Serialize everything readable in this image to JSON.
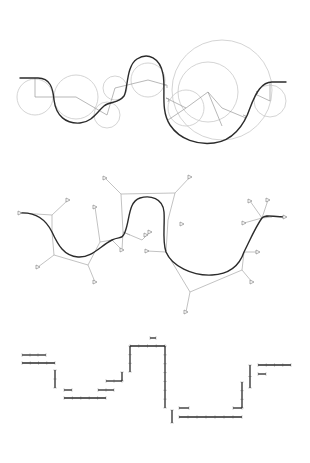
{
  "figure": {
    "panels": [
      {
        "id": "circles",
        "description": "Curve built from tangent circular arcs with radial construction lines",
        "colors": {
          "curve": "#2b2b2b",
          "construction": "#c9c9c9",
          "radials": "#9a9a9a"
        },
        "curve_points": "M20,78 L38,78 C50,78 53,88 54,100 C56,116 66,124 80,123 C92,122 97,112 104,106 C110,101 118,104 124,96 C128,90 126,66 137,59 C148,52 160,58 163,74 C166,88 160,110 170,125 C180,140 198,145 214,143 C232,141 244,126 250,108 C256,92 262,82 272,82 L286,82",
        "circles": [
          {
            "cx": 35,
            "cy": 97,
            "r": 18
          },
          {
            "cx": 76,
            "cy": 97,
            "r": 22
          },
          {
            "cx": 115,
            "cy": 88,
            "r": 12
          },
          {
            "cx": 107,
            "cy": 115,
            "r": 13
          },
          {
            "cx": 148,
            "cy": 80,
            "r": 17
          },
          {
            "cx": 186,
            "cy": 108,
            "r": 18
          },
          {
            "cx": 208,
            "cy": 92,
            "r": 30
          },
          {
            "cx": 222,
            "cy": 90,
            "r": 50
          },
          {
            "cx": 270,
            "cy": 101,
            "r": 16
          }
        ],
        "radials": "M35,78 L35,97 L76,97 L107,115 L115,88 L148,80 L166,85 M166,98 L186,108 L208,92 L222,126 M208,92 L222,108 L246,118 M186,108 L168,120 M270,82 L270,101 L255,94"
      },
      {
        "id": "polygons",
        "description": "Spline curve with control polygons and handle markers",
        "colors": {
          "curve": "#2b2b2b",
          "polygon": "#a8a8a8",
          "marker": "#8a8a8a"
        },
        "curve_points": "M20,53 C35,52 45,58 52,72 C58,85 64,96 78,97 C92,98 100,86 112,80 C120,76 122,80 125,72 C130,60 128,42 140,38 C150,35 163,38 164,52 C165,66 162,80 166,92 C172,106 192,116 212,115 C232,114 240,104 244,92 C250,80 256,66 262,58 C266,54 272,57 285,57",
        "polygons": "M52,55 L52,72 L54,95 L88,105 L100,82 L112,80 M52,55 L20,53 M52,55 L68,40 M54,95 L38,107 M88,105 L95,122 M100,82 L95,47 M112,80 L122,90 M122,90 L123,72 L130,75 M123,72 L142,80 L150,72 M123,72 L121,34 L175,33 L168,60 L166,92 M121,34 L105,18 M175,33 L190,17 M166,92 L147,91 M166,92 L190,132 L242,110 L244,92 M190,132 L186,152 M242,110 L252,122 M244,92 L258,92 M262,58 L272,57 M262,58 L250,41 M262,58 L268,40 M262,58 L244,63"
      },
      {
        "id": "steps",
        "description": "Staircase of axis-aligned bars with tick marks",
        "colors": {
          "bar": "#2b2b2b",
          "tick": "#b5b5b5"
        }
      }
    ]
  }
}
